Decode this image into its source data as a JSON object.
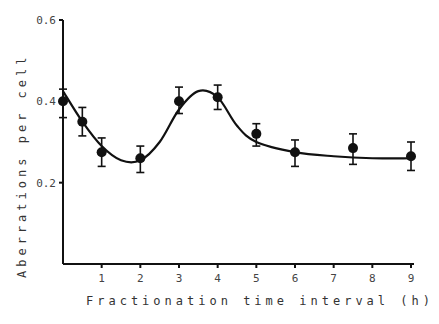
{
  "chart_data": {
    "type": "scatter",
    "title": "",
    "xlabel": "Fractionation time interval (h)",
    "ylabel": "Aberrations per cell",
    "xlim": [
      0,
      9
    ],
    "ylim": [
      0,
      0.6
    ],
    "xticks": [
      "1",
      "2",
      "3",
      "4",
      "5",
      "6",
      "7",
      "8",
      "9"
    ],
    "yticks": [
      "0.2",
      "0.4",
      "0.6"
    ],
    "grid": false,
    "legend": null,
    "series": [
      {
        "name": "observed",
        "x": [
          0,
          0.5,
          1,
          2,
          3,
          4,
          5,
          6,
          7.5,
          9
        ],
        "y": [
          0.4,
          0.35,
          0.275,
          0.26,
          0.4,
          0.41,
          0.32,
          0.275,
          0.285,
          0.265
        ],
        "err_low": [
          0.36,
          0.315,
          0.24,
          0.225,
          0.37,
          0.38,
          0.29,
          0.24,
          0.245,
          0.23
        ],
        "err_high": [
          0.43,
          0.385,
          0.31,
          0.29,
          0.435,
          0.44,
          0.345,
          0.305,
          0.32,
          0.3
        ]
      },
      {
        "name": "fitted curve",
        "x": [
          0,
          0.5,
          1,
          1.5,
          2,
          2.5,
          3,
          3.5,
          4,
          4.5,
          5,
          6,
          7,
          8,
          9
        ],
        "y": [
          0.425,
          0.35,
          0.29,
          0.255,
          0.255,
          0.3,
          0.38,
          0.425,
          0.41,
          0.34,
          0.3,
          0.275,
          0.265,
          0.26,
          0.26
        ]
      }
    ]
  }
}
